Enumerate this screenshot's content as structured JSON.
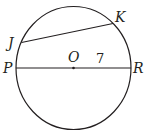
{
  "diagram": {
    "type": "circle-geometry",
    "colors": {
      "stroke": "#231f20",
      "background": "#ffffff"
    },
    "circle": {
      "center_label": "O"
    },
    "points": {
      "P": "P",
      "R": "R",
      "J": "J",
      "K": "K",
      "O": "O"
    },
    "segments": [
      {
        "name": "diameter",
        "from": "P",
        "to": "R"
      },
      {
        "name": "chord",
        "from": "J",
        "to": "K"
      }
    ],
    "measurements": {
      "OR": "7"
    }
  }
}
